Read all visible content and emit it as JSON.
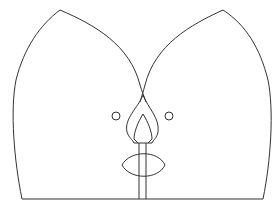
{
  "canvas": {
    "width": 280,
    "height": 218,
    "background": "#ffffff"
  },
  "drawing": {
    "description": "Line drawing of a stylized figure: two large petal/arch shapes crossing at center, two small circles, a flame/bud shape on a stem, and an eye/lens shape crossing the stem",
    "stroke_color": "#333333",
    "elements": [
      {
        "name": "left-arch",
        "type": "path"
      },
      {
        "name": "right-arch",
        "type": "path"
      },
      {
        "name": "base-line",
        "type": "line"
      },
      {
        "name": "left-circle",
        "type": "circle",
        "cx": 116,
        "cy": 116,
        "r": 4
      },
      {
        "name": "right-circle",
        "type": "circle",
        "cx": 169,
        "cy": 116,
        "r": 4
      },
      {
        "name": "flame-outer",
        "type": "path"
      },
      {
        "name": "flame-inner",
        "type": "path"
      },
      {
        "name": "stem",
        "type": "rect"
      },
      {
        "name": "lens",
        "type": "path"
      }
    ]
  }
}
